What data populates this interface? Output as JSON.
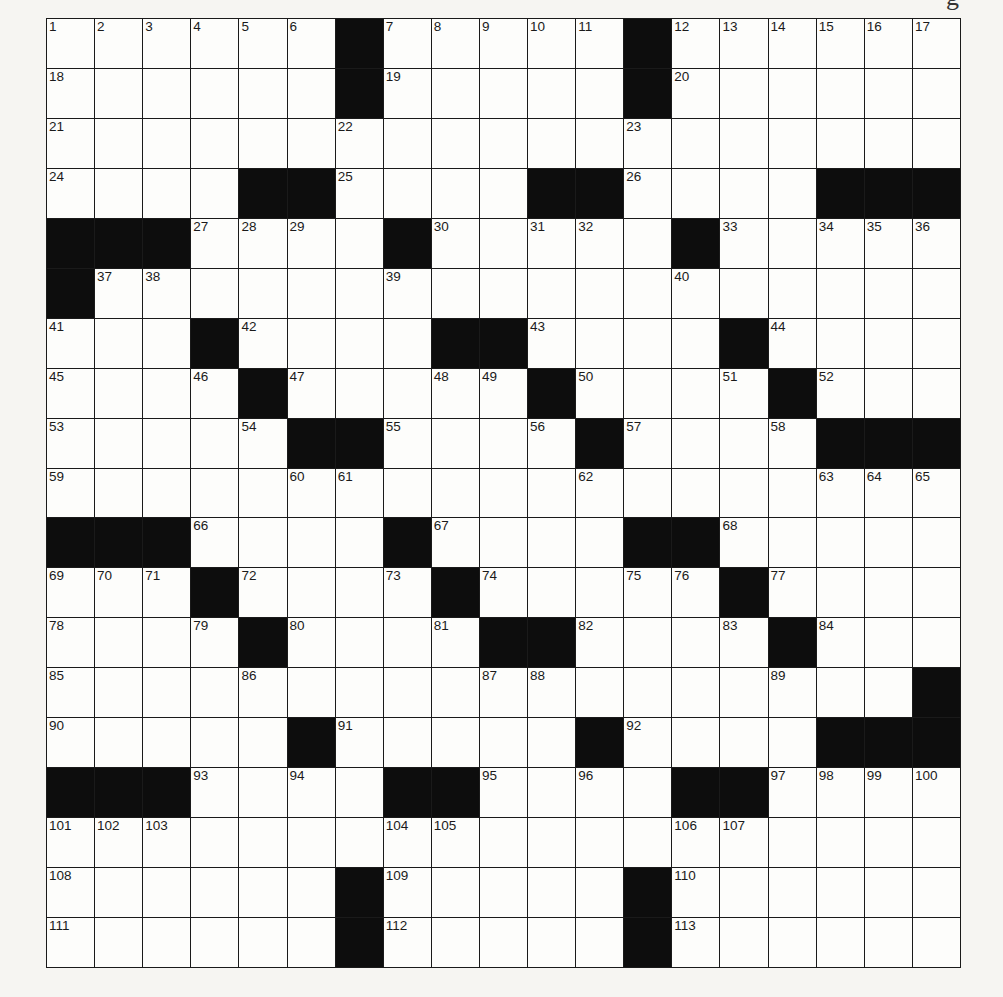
{
  "page": {
    "title_fragment": "g"
  },
  "crossword": {
    "rows": 19,
    "cols": 19,
    "colors": {
      "block": "#0d0d0d",
      "cell": "#fdfdfb",
      "line": "#1a1a1a",
      "paper": "#f6f5f2"
    },
    "layout": [
      "......#.....#......",
      "......#.....#......",
      "...................",
      "....##....##....###",
      "###....#.....#.....",
      "#..................",
      "...#....##....#....",
      "....#.....#....#...",
      ".....##....#....###",
      "...................",
      "###....#....##.....",
      "...#....#.....#....",
      "....#....##....#...",
      "..................#",
      ".....#.....#....###",
      "###....##....##....",
      "...................",
      "......#.....#......",
      "......#.....#......"
    ],
    "numbers": [
      {
        "r": 0,
        "c": 0,
        "n": "1"
      },
      {
        "r": 0,
        "c": 1,
        "n": "2"
      },
      {
        "r": 0,
        "c": 2,
        "n": "3"
      },
      {
        "r": 0,
        "c": 3,
        "n": "4"
      },
      {
        "r": 0,
        "c": 4,
        "n": "5"
      },
      {
        "r": 0,
        "c": 5,
        "n": "6"
      },
      {
        "r": 0,
        "c": 7,
        "n": "7"
      },
      {
        "r": 0,
        "c": 8,
        "n": "8"
      },
      {
        "r": 0,
        "c": 9,
        "n": "9"
      },
      {
        "r": 0,
        "c": 10,
        "n": "10"
      },
      {
        "r": 0,
        "c": 11,
        "n": "11"
      },
      {
        "r": 0,
        "c": 13,
        "n": "12"
      },
      {
        "r": 0,
        "c": 14,
        "n": "13"
      },
      {
        "r": 0,
        "c": 15,
        "n": "14"
      },
      {
        "r": 0,
        "c": 16,
        "n": "15"
      },
      {
        "r": 0,
        "c": 17,
        "n": "16"
      },
      {
        "r": 0,
        "c": 18,
        "n": "17"
      },
      {
        "r": 1,
        "c": 0,
        "n": "18"
      },
      {
        "r": 1,
        "c": 7,
        "n": "19"
      },
      {
        "r": 1,
        "c": 13,
        "n": "20"
      },
      {
        "r": 2,
        "c": 0,
        "n": "21"
      },
      {
        "r": 2,
        "c": 6,
        "n": "22"
      },
      {
        "r": 2,
        "c": 12,
        "n": "23"
      },
      {
        "r": 3,
        "c": 0,
        "n": "24"
      },
      {
        "r": 3,
        "c": 6,
        "n": "25"
      },
      {
        "r": 3,
        "c": 12,
        "n": "26"
      },
      {
        "r": 4,
        "c": 3,
        "n": "27"
      },
      {
        "r": 4,
        "c": 4,
        "n": "28"
      },
      {
        "r": 4,
        "c": 5,
        "n": "29"
      },
      {
        "r": 4,
        "c": 8,
        "n": "30"
      },
      {
        "r": 4,
        "c": 10,
        "n": "31"
      },
      {
        "r": 4,
        "c": 11,
        "n": "32"
      },
      {
        "r": 4,
        "c": 14,
        "n": "33"
      },
      {
        "r": 4,
        "c": 16,
        "n": "34"
      },
      {
        "r": 4,
        "c": 17,
        "n": "35"
      },
      {
        "r": 4,
        "c": 18,
        "n": "36"
      },
      {
        "r": 5,
        "c": 1,
        "n": "37"
      },
      {
        "r": 5,
        "c": 2,
        "n": "38"
      },
      {
        "r": 5,
        "c": 7,
        "n": "39"
      },
      {
        "r": 5,
        "c": 13,
        "n": "40"
      },
      {
        "r": 6,
        "c": 0,
        "n": "41"
      },
      {
        "r": 6,
        "c": 4,
        "n": "42"
      },
      {
        "r": 6,
        "c": 10,
        "n": "43"
      },
      {
        "r": 6,
        "c": 15,
        "n": "44"
      },
      {
        "r": 7,
        "c": 0,
        "n": "45"
      },
      {
        "r": 7,
        "c": 3,
        "n": "46"
      },
      {
        "r": 7,
        "c": 5,
        "n": "47"
      },
      {
        "r": 7,
        "c": 8,
        "n": "48"
      },
      {
        "r": 7,
        "c": 9,
        "n": "49"
      },
      {
        "r": 7,
        "c": 11,
        "n": "50"
      },
      {
        "r": 7,
        "c": 14,
        "n": "51"
      },
      {
        "r": 7,
        "c": 16,
        "n": "52"
      },
      {
        "r": 8,
        "c": 0,
        "n": "53"
      },
      {
        "r": 8,
        "c": 4,
        "n": "54"
      },
      {
        "r": 8,
        "c": 7,
        "n": "55"
      },
      {
        "r": 8,
        "c": 10,
        "n": "56"
      },
      {
        "r": 8,
        "c": 12,
        "n": "57"
      },
      {
        "r": 8,
        "c": 15,
        "n": "58"
      },
      {
        "r": 9,
        "c": 0,
        "n": "59"
      },
      {
        "r": 9,
        "c": 5,
        "n": "60"
      },
      {
        "r": 9,
        "c": 6,
        "n": "61"
      },
      {
        "r": 9,
        "c": 11,
        "n": "62"
      },
      {
        "r": 9,
        "c": 16,
        "n": "63"
      },
      {
        "r": 9,
        "c": 17,
        "n": "64"
      },
      {
        "r": 9,
        "c": 18,
        "n": "65"
      },
      {
        "r": 10,
        "c": 3,
        "n": "66"
      },
      {
        "r": 10,
        "c": 8,
        "n": "67"
      },
      {
        "r": 10,
        "c": 14,
        "n": "68"
      },
      {
        "r": 11,
        "c": 0,
        "n": "69"
      },
      {
        "r": 11,
        "c": 1,
        "n": "70"
      },
      {
        "r": 11,
        "c": 2,
        "n": "71"
      },
      {
        "r": 11,
        "c": 4,
        "n": "72"
      },
      {
        "r": 11,
        "c": 7,
        "n": "73"
      },
      {
        "r": 11,
        "c": 9,
        "n": "74"
      },
      {
        "r": 11,
        "c": 12,
        "n": "75"
      },
      {
        "r": 11,
        "c": 13,
        "n": "76"
      },
      {
        "r": 11,
        "c": 15,
        "n": "77"
      },
      {
        "r": 12,
        "c": 0,
        "n": "78"
      },
      {
        "r": 12,
        "c": 3,
        "n": "79"
      },
      {
        "r": 12,
        "c": 5,
        "n": "80"
      },
      {
        "r": 12,
        "c": 8,
        "n": "81"
      },
      {
        "r": 12,
        "c": 11,
        "n": "82"
      },
      {
        "r": 12,
        "c": 14,
        "n": "83"
      },
      {
        "r": 12,
        "c": 16,
        "n": "84"
      },
      {
        "r": 13,
        "c": 0,
        "n": "85"
      },
      {
        "r": 13,
        "c": 4,
        "n": "86"
      },
      {
        "r": 13,
        "c": 9,
        "n": "87"
      },
      {
        "r": 13,
        "c": 10,
        "n": "88"
      },
      {
        "r": 13,
        "c": 15,
        "n": "89"
      },
      {
        "r": 14,
        "c": 0,
        "n": "90"
      },
      {
        "r": 14,
        "c": 6,
        "n": "91"
      },
      {
        "r": 14,
        "c": 12,
        "n": "92"
      },
      {
        "r": 15,
        "c": 3,
        "n": "93"
      },
      {
        "r": 15,
        "c": 5,
        "n": "94"
      },
      {
        "r": 15,
        "c": 9,
        "n": "95"
      },
      {
        "r": 15,
        "c": 11,
        "n": "96"
      },
      {
        "r": 15,
        "c": 15,
        "n": "97"
      },
      {
        "r": 15,
        "c": 16,
        "n": "98"
      },
      {
        "r": 15,
        "c": 17,
        "n": "99"
      },
      {
        "r": 15,
        "c": 18,
        "n": "100"
      },
      {
        "r": 16,
        "c": 0,
        "n": "101"
      },
      {
        "r": 16,
        "c": 1,
        "n": "102"
      },
      {
        "r": 16,
        "c": 2,
        "n": "103"
      },
      {
        "r": 16,
        "c": 7,
        "n": "104"
      },
      {
        "r": 16,
        "c": 8,
        "n": "105"
      },
      {
        "r": 16,
        "c": 13,
        "n": "106"
      },
      {
        "r": 16,
        "c": 14,
        "n": "107"
      },
      {
        "r": 17,
        "c": 0,
        "n": "108"
      },
      {
        "r": 17,
        "c": 7,
        "n": "109"
      },
      {
        "r": 17,
        "c": 13,
        "n": "110"
      },
      {
        "r": 18,
        "c": 0,
        "n": "111"
      },
      {
        "r": 18,
        "c": 7,
        "n": "112"
      },
      {
        "r": 18,
        "c": 13,
        "n": "113"
      }
    ]
  }
}
